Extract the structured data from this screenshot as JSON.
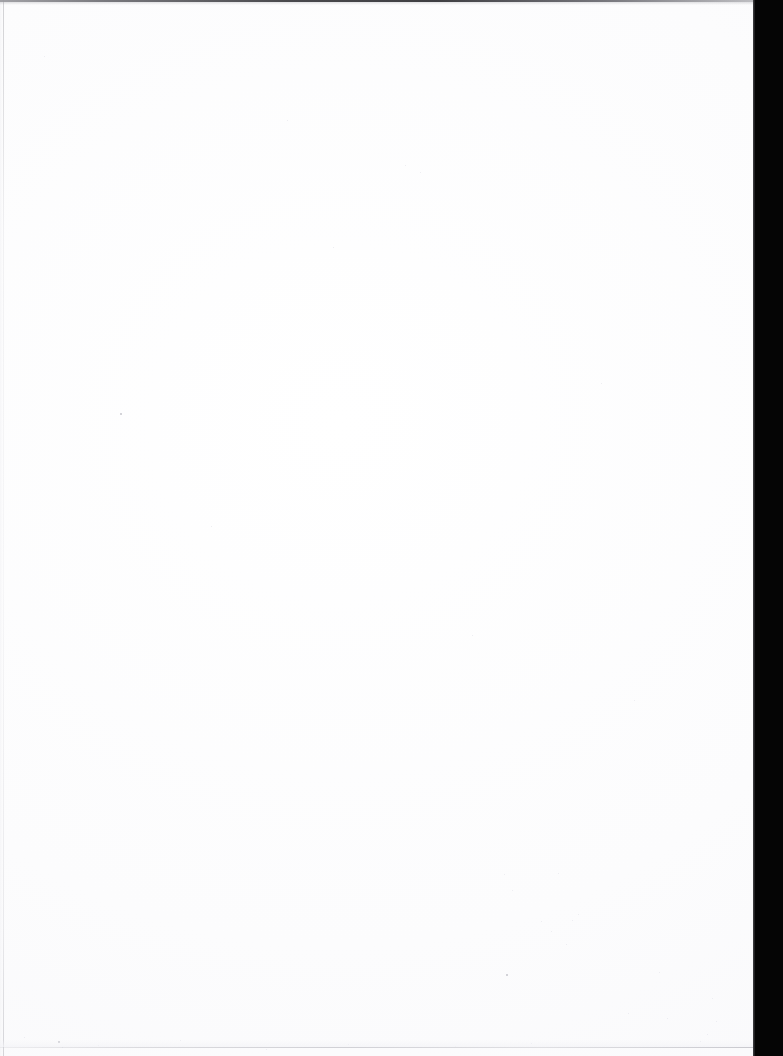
{
  "document": {
    "type": "scanned-page",
    "page_state": "blank",
    "visible_text": "",
    "page_width_px": 783,
    "page_height_px": 1056
  },
  "canvas": {
    "background_color": "#ffffff",
    "paper_color": "#ffffff",
    "paper_width_px": 753,
    "paper_height_px": 1056
  },
  "artifacts": {
    "right_gutter": {
      "name": "scanner-gutter",
      "color": "#050505",
      "left_px": 753,
      "width_px": 30,
      "height_px": 1056
    },
    "top_edge_line": {
      "name": "top-scan-line",
      "color": "#3a3a3e",
      "top_px": 0,
      "height_px": 2
    },
    "left_edge_line": {
      "name": "left-page-edge",
      "color": "#c4c4ca",
      "left_px": 3,
      "width_px": 1
    },
    "bottom_edge_line": {
      "name": "bottom-page-edge",
      "color": "#b2b2ba",
      "top_px": 1047,
      "height_px": 1
    }
  },
  "specks": [
    {
      "x": 120,
      "y": 413,
      "size": 2,
      "tone": "dark"
    },
    {
      "x": 211,
      "y": 526,
      "size": 1,
      "tone": "dim"
    },
    {
      "x": 287,
      "y": 120,
      "size": 1,
      "tone": "dim"
    },
    {
      "x": 333,
      "y": 247,
      "size": 1,
      "tone": "dim"
    },
    {
      "x": 405,
      "y": 165,
      "size": 1,
      "tone": "dim"
    },
    {
      "x": 420,
      "y": 172,
      "size": 1,
      "tone": "dim"
    },
    {
      "x": 472,
      "y": 635,
      "size": 1,
      "tone": "dim"
    },
    {
      "x": 504,
      "y": 874,
      "size": 1,
      "tone": "dim"
    },
    {
      "x": 506,
      "y": 974,
      "size": 2,
      "tone": "dark"
    },
    {
      "x": 512,
      "y": 890,
      "size": 1,
      "tone": "dim"
    },
    {
      "x": 541,
      "y": 921,
      "size": 1,
      "tone": "dim"
    },
    {
      "x": 551,
      "y": 931,
      "size": 1,
      "tone": "dim"
    },
    {
      "x": 558,
      "y": 873,
      "size": 1,
      "tone": "dim"
    },
    {
      "x": 566,
      "y": 944,
      "size": 1,
      "tone": "dim"
    },
    {
      "x": 572,
      "y": 920,
      "size": 1,
      "tone": "dim"
    },
    {
      "x": 578,
      "y": 914,
      "size": 1,
      "tone": "dim"
    },
    {
      "x": 601,
      "y": 383,
      "size": 1,
      "tone": "dim"
    },
    {
      "x": 628,
      "y": 1013,
      "size": 1,
      "tone": "dim"
    },
    {
      "x": 634,
      "y": 700,
      "size": 1,
      "tone": "dim"
    },
    {
      "x": 659,
      "y": 972,
      "size": 1,
      "tone": "dim"
    },
    {
      "x": 667,
      "y": 1018,
      "size": 1,
      "tone": "dim"
    },
    {
      "x": 700,
      "y": 1041,
      "size": 1,
      "tone": "dim"
    },
    {
      "x": 707,
      "y": 1034,
      "size": 1,
      "tone": "dim"
    },
    {
      "x": 712,
      "y": 998,
      "size": 1,
      "tone": "dim"
    },
    {
      "x": 716,
      "y": 1021,
      "size": 1,
      "tone": "dim"
    },
    {
      "x": 58,
      "y": 1041,
      "size": 2,
      "tone": "dark"
    },
    {
      "x": 62,
      "y": 1047,
      "size": 1,
      "tone": "dim"
    },
    {
      "x": 44,
      "y": 56,
      "size": 1,
      "tone": "dim"
    },
    {
      "x": 24,
      "y": 1037,
      "size": 1,
      "tone": "dim"
    },
    {
      "x": 98,
      "y": 1045,
      "size": 1,
      "tone": "dim"
    },
    {
      "x": 180,
      "y": 1040,
      "size": 1,
      "tone": "dim"
    },
    {
      "x": 266,
      "y": 1049,
      "size": 1,
      "tone": "dim"
    },
    {
      "x": 348,
      "y": 1044,
      "size": 1,
      "tone": "dim"
    },
    {
      "x": 455,
      "y": 1046,
      "size": 1,
      "tone": "dim"
    },
    {
      "x": 531,
      "y": 1043,
      "size": 1,
      "tone": "dim"
    }
  ]
}
